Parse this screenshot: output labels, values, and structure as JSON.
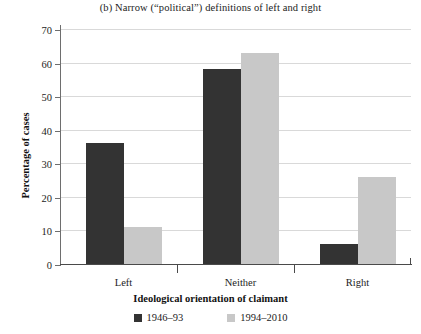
{
  "chart_data": {
    "type": "bar",
    "title": "(b) Narrow (“political”) definitions of left and right",
    "xlabel": "Ideological orientation of claimant",
    "ylabel": "Percentage of cases",
    "categories": [
      "Left",
      "Neither",
      "Right"
    ],
    "series": [
      {
        "name": "1946–93",
        "color": "#333333",
        "values": [
          36,
          58,
          6
        ]
      },
      {
        "name": "1994–2010",
        "color": "#c8c8c8",
        "values": [
          11,
          63,
          26
        ]
      }
    ],
    "ylim": [
      0,
      70
    ],
    "yticks": [
      0,
      10,
      20,
      30,
      40,
      50,
      60,
      70
    ],
    "ytick_labels": [
      "0",
      "10",
      "20",
      "30",
      "40",
      "50",
      "60",
      "70"
    ],
    "grid": "horizontal",
    "legend_position": "bottom-center"
  }
}
